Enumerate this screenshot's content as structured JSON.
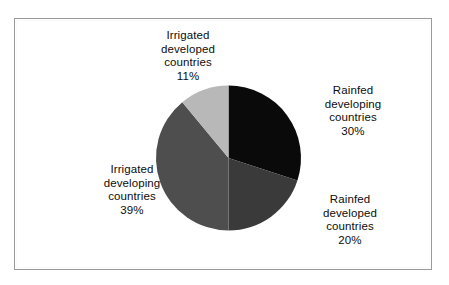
{
  "figure": {
    "background_color": "#ffffff",
    "border_color": "#9a9a9a"
  },
  "chart_data": {
    "type": "pie",
    "title": "",
    "subtitle": "",
    "xlabel": "",
    "ylabel": "",
    "legend_position": "none",
    "grid": false,
    "start_angle_deg": 0,
    "direction": "clockwise",
    "categories": [
      "Rainfed developing countries",
      "Rainfed developed countries",
      "Irrigated developing countries",
      "Irrigated developed countries"
    ],
    "values": [
      30,
      20,
      39,
      11
    ],
    "value_unit": "%",
    "colors": [
      "#0a0a0a",
      "#3a3a3a",
      "#4e4e4e",
      "#b8b8b8"
    ],
    "slices": [
      {
        "name": "Rainfed developing countries",
        "value": 30,
        "label_percent": "30%",
        "color": "#0a0a0a",
        "start_deg": 0,
        "end_deg": 108
      },
      {
        "name": "Rainfed developed countries",
        "value": 20,
        "label_percent": "20%",
        "color": "#3a3a3a",
        "start_deg": 108,
        "end_deg": 180
      },
      {
        "name": "Irrigated developing countries",
        "value": 39,
        "label_percent": "39%",
        "color": "#4e4e4e",
        "start_deg": 180,
        "end_deg": 320.4
      },
      {
        "name": "Irrigated developed countries",
        "value": 11,
        "label_percent": "11%",
        "color": "#b8b8b8",
        "start_deg": 320.4,
        "end_deg": 360
      }
    ]
  },
  "labels": {
    "irrigated_developed": {
      "line1": "Irrigated",
      "line2": "developed",
      "line3": "countries",
      "percent": "11%"
    },
    "rainfed_developing": {
      "line1": "Rainfed",
      "line2": "developing",
      "line3": "countries",
      "percent": "30%"
    },
    "rainfed_developed": {
      "line1": "Rainfed",
      "line2": "developed",
      "line3": "countries",
      "percent": "20%"
    },
    "irrigated_developing": {
      "line1": "Irrigated",
      "line2": "developing",
      "line3": "countries",
      "percent": "39%"
    }
  }
}
